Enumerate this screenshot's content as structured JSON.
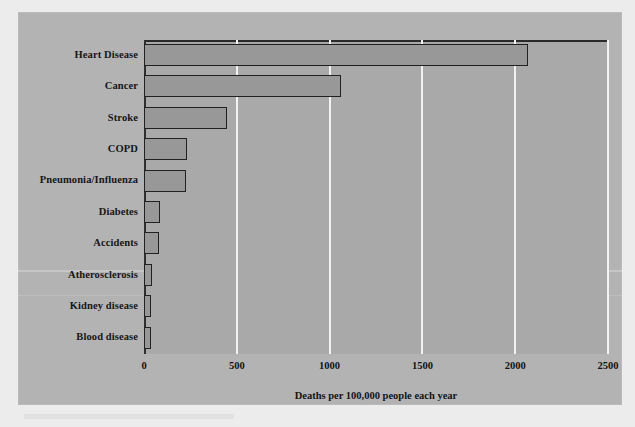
{
  "chart_data": {
    "type": "bar",
    "orientation": "horizontal",
    "title": "",
    "xlabel": "Deaths per 100,000 people each year",
    "ylabel": "",
    "xlim": [
      0,
      2500
    ],
    "xticks": [
      0,
      500,
      1000,
      1500,
      2000,
      2500
    ],
    "xtick_labels": [
      "0",
      "500",
      "1000",
      "1500",
      "2000",
      "2500"
    ],
    "grid": "vertical gridlines at each x tick, white",
    "legend": "none",
    "categories": [
      "Heart Disease",
      "Cancer",
      "Stroke",
      "COPD",
      "Pneumonia/Influenza",
      "Diabetes",
      "Accidents",
      "Atherosclerosis",
      "Kidney disease",
      "Blood disease"
    ],
    "values": [
      2070,
      1060,
      445,
      230,
      225,
      88,
      82,
      42,
      40,
      38
    ],
    "bar_fill_color": "#989898",
    "bar_edge_color": "#212121",
    "plot_background_color": "#a9a9a9",
    "panel_background_color": "#b3b3b3",
    "gridline_color": "#f2f2f2",
    "text_color": "#141414"
  },
  "axis": {
    "x_title": "Deaths per 100,000 people each year",
    "tick_0": "0",
    "tick_500": "500",
    "tick_1000": "1000",
    "tick_1500": "1500",
    "tick_2000": "2000",
    "tick_2500": "2500"
  }
}
